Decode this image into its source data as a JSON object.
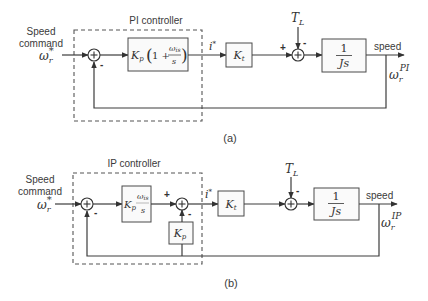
{
  "figure_a": {
    "caption": "(a)",
    "controller_label": "PI controller",
    "input": {
      "line1": "Speed",
      "line2": "command",
      "symbol": "ω",
      "sub": "r",
      "sup": "*"
    },
    "controller_block": {
      "gain": "K",
      "gain_sub": "p",
      "open": "(",
      "one_plus": "1 +",
      "num": "ω",
      "num_sub": "is",
      "den": "s",
      "close": ")"
    },
    "current_ref": {
      "symbol": "i",
      "sup": "*"
    },
    "torque_block": {
      "symbol": "K",
      "sub": "t"
    },
    "load_torque": {
      "symbol": "T",
      "sub": "L"
    },
    "plant_block": {
      "num": "1",
      "den": "Js"
    },
    "output": {
      "label": "speed",
      "symbol": "ω",
      "sub": "r",
      "sup": "PI"
    },
    "signs": {
      "sum1_feedback": "-",
      "sum2_plus": "+",
      "sum2_load": "-"
    }
  },
  "figure_b": {
    "caption": "(b)",
    "controller_label": "IP controller",
    "input": {
      "line1": "Speed",
      "line2": "command",
      "symbol": "ω",
      "sub": "r",
      "sup": "*"
    },
    "integral_block": {
      "gain": "K",
      "gain_sub": "p",
      "num": "ω",
      "num_sub": "is",
      "den": "s"
    },
    "proportional_block": {
      "symbol": "K",
      "sub": "p"
    },
    "current_ref": {
      "symbol": "i",
      "sup": "*"
    },
    "torque_block": {
      "symbol": "K",
      "sub": "t"
    },
    "load_torque": {
      "symbol": "T",
      "sub": "L"
    },
    "plant_block": {
      "num": "1",
      "den": "Js"
    },
    "output": {
      "label": "speed",
      "symbol": "ω",
      "sub": "r",
      "sup": "IP"
    },
    "signs": {
      "sum1_feedback": "-",
      "sum2_plus": "+",
      "sum2_prop": "-",
      "sum3_load": "-"
    }
  }
}
